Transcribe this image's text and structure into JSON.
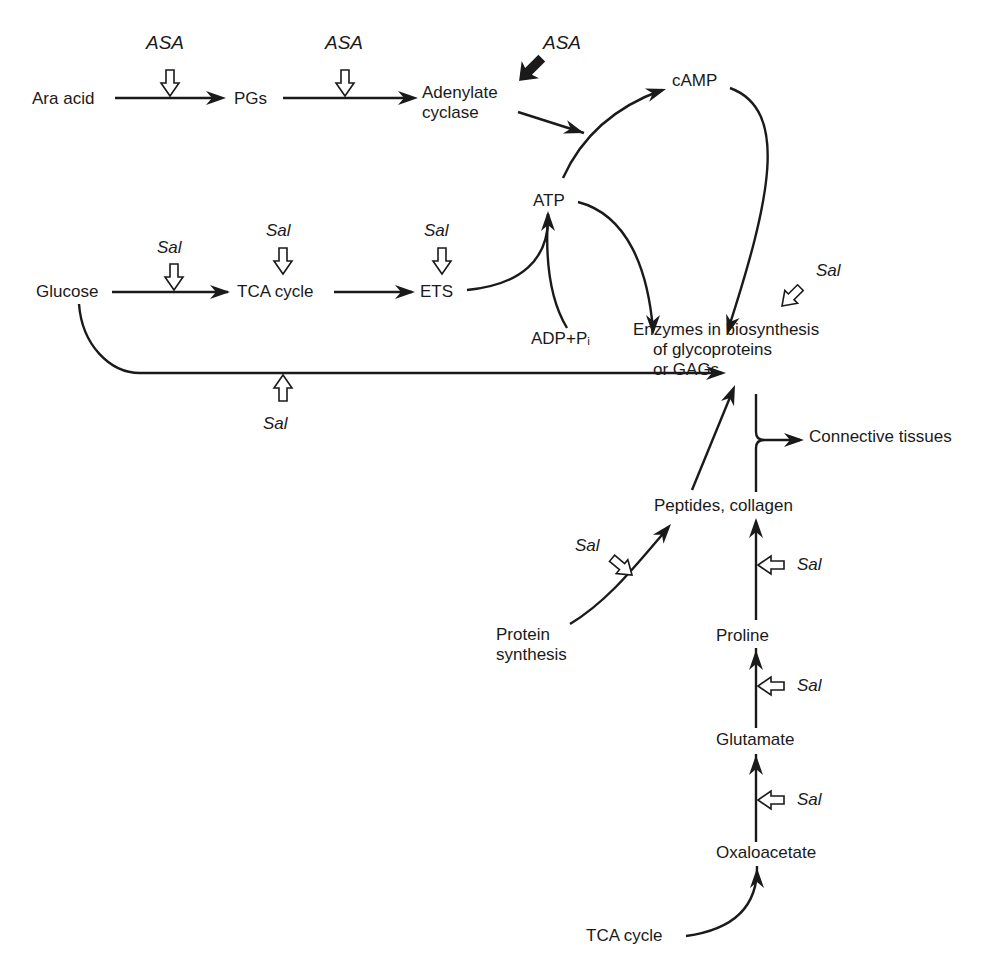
{
  "diagram": {
    "title": "",
    "nodes": [
      {
        "id": "ara_acid",
        "lines": [
          "Ara acid"
        ],
        "x": 32,
        "y": 104
      },
      {
        "id": "pgs",
        "lines": [
          "PGs"
        ],
        "x": 234,
        "y": 104
      },
      {
        "id": "adenylate_cyclase",
        "lines": [
          "Adenylate",
          "cyclase"
        ],
        "x": 422,
        "y": 98
      },
      {
        "id": "camp",
        "lines": [
          "cAMP"
        ],
        "x": 672,
        "y": 86
      },
      {
        "id": "atp",
        "lines": [
          "ATP"
        ],
        "x": 533,
        "y": 206
      },
      {
        "id": "glucose",
        "lines": [
          "Glucose"
        ],
        "x": 36,
        "y": 297
      },
      {
        "id": "tca_cycle_1",
        "lines": [
          "TCA cycle"
        ],
        "x": 237,
        "y": 297
      },
      {
        "id": "ets",
        "lines": [
          "ETS"
        ],
        "x": 420,
        "y": 297
      },
      {
        "id": "adp_pi",
        "lines": [
          "ADP+Pᵢ"
        ],
        "x": 531,
        "y": 344
      },
      {
        "id": "enzymes",
        "lines": [
          "Enzymes in biosynthesis",
          "of glycoproteins",
          "or GAGs"
        ],
        "x": 633,
        "y": 335
      },
      {
        "id": "connective_tissues",
        "lines": [
          "Connective tissues"
        ],
        "x": 809,
        "y": 442
      },
      {
        "id": "peptides_collagen",
        "lines": [
          "Peptides, collagen"
        ],
        "x": 654,
        "y": 511
      },
      {
        "id": "protein_synthesis",
        "lines": [
          "Protein",
          "synthesis"
        ],
        "x": 496,
        "y": 640
      },
      {
        "id": "proline",
        "lines": [
          "Proline"
        ],
        "x": 716,
        "y": 641
      },
      {
        "id": "glutamate",
        "lines": [
          "Glutamate"
        ],
        "x": 716,
        "y": 745
      },
      {
        "id": "oxaloacetate",
        "lines": [
          "Oxaloacetate"
        ],
        "x": 716,
        "y": 858
      },
      {
        "id": "tca_cycle_2",
        "lines": [
          "TCA cycle"
        ],
        "x": 586,
        "y": 941
      }
    ],
    "drug_labels": [
      {
        "id": "asa_1",
        "text": "ASA",
        "x": 146,
        "y": 49,
        "size": "asa"
      },
      {
        "id": "asa_2",
        "text": "ASA",
        "x": 325,
        "y": 49,
        "size": "asa"
      },
      {
        "id": "asa_3",
        "text": "ASA",
        "x": 543,
        "y": 49,
        "size": "asa"
      },
      {
        "id": "sal_1",
        "text": "Sal",
        "x": 157,
        "y": 253,
        "size": "sal"
      },
      {
        "id": "sal_2",
        "text": "Sal",
        "x": 266,
        "y": 236,
        "size": "sal"
      },
      {
        "id": "sal_3",
        "text": "Sal",
        "x": 424,
        "y": 236,
        "size": "sal"
      },
      {
        "id": "sal_4",
        "text": "Sal",
        "x": 263,
        "y": 429,
        "size": "sal"
      },
      {
        "id": "sal_5",
        "text": "Sal",
        "x": 816,
        "y": 276,
        "size": "sal"
      },
      {
        "id": "sal_6",
        "text": "Sal",
        "x": 575,
        "y": 551,
        "size": "sal"
      },
      {
        "id": "sal_7",
        "text": "Sal",
        "x": 797,
        "y": 570,
        "size": "sal"
      },
      {
        "id": "sal_8",
        "text": "Sal",
        "x": 797,
        "y": 691,
        "size": "sal"
      },
      {
        "id": "sal_9",
        "text": "Sal",
        "x": 797,
        "y": 805,
        "size": "sal"
      }
    ],
    "edges": [
      {
        "id": "ara_to_pgs",
        "d": "M 115 98 L 218 98"
      },
      {
        "id": "pgs_to_adenylate",
        "d": "M 283 98 L 412 98"
      },
      {
        "id": "adenylate_to_junction",
        "d": "M 518 112 L 584 133"
      },
      {
        "id": "atp_to_camp",
        "d": "M 563 178 C 580 140, 612 108, 662 90"
      },
      {
        "id": "camp_to_enzymes",
        "d": "M 730 88 C 790 110, 770 200, 728 330"
      },
      {
        "id": "atp_to_enzymes",
        "d": "M 578 202 C 628 215, 648 270, 653 330"
      },
      {
        "id": "glucose_to_tca",
        "d": "M 112 292 L 228 292"
      },
      {
        "id": "tca_to_ets",
        "d": "M 334 292 L 412 292"
      },
      {
        "id": "ets_to_atp",
        "d": "M 467 290 C 520 285, 550 260, 548 214"
      },
      {
        "id": "adp_to_atp",
        "d": "M 567 328 C 550 300, 545 260, 548 214"
      },
      {
        "id": "glucose_to_enzymes",
        "d": "M 79 304 C 82 345, 110 373, 140 373 L 722 373"
      },
      {
        "id": "peptides_to_enzymes",
        "d": "M 692 490 L 733 390"
      },
      {
        "id": "bracket_upper",
        "d": "M 756 394 L 756 432 Q 756 440 764 440"
      },
      {
        "id": "bracket_lower",
        "d": "M 756 492 L 756 448 Q 756 440 764 440"
      },
      {
        "id": "bracket_to_connective",
        "d": "M 764 440 L 800 440"
      },
      {
        "id": "protein_to_peptides",
        "d": "M 570 624 C 610 600, 640 560, 668 528"
      },
      {
        "id": "proline_to_peptides",
        "d": "M 756 620 L 756 522"
      },
      {
        "id": "glutamate_to_proline",
        "d": "M 756 728 L 756 648"
      },
      {
        "id": "oxaloacetate_to_glutamate",
        "d": "M 756 842 L 756 754"
      },
      {
        "id": "tca_to_oxaloacetate",
        "d": "M 686 936 C 730 930, 758 910, 757 866"
      }
    ],
    "arrowheads": [
      {
        "id": "ah_pgs",
        "x": 226,
        "y": 98,
        "angle": 0
      },
      {
        "id": "ah_adenylate",
        "x": 418,
        "y": 98,
        "angle": 0
      },
      {
        "id": "ah_junction",
        "x": 584,
        "y": 133,
        "angle": 18
      },
      {
        "id": "ah_camp",
        "x": 666,
        "y": 89,
        "angle": -18
      },
      {
        "id": "ah_enzymes_camp",
        "x": 727,
        "y": 335,
        "angle": 107
      },
      {
        "id": "ah_enzymes_atp",
        "x": 653,
        "y": 335,
        "angle": 90
      },
      {
        "id": "ah_tca",
        "x": 230,
        "y": 292,
        "angle": 0
      },
      {
        "id": "ah_ets",
        "x": 415,
        "y": 292,
        "angle": 0
      },
      {
        "id": "ah_atp",
        "x": 548,
        "y": 211,
        "angle": -90
      },
      {
        "id": "ah_enzymes_glucose",
        "x": 726,
        "y": 373,
        "angle": 0
      },
      {
        "id": "ah_enzymes_peptides",
        "x": 735,
        "y": 385,
        "angle": -68
      },
      {
        "id": "ah_connective",
        "x": 804,
        "y": 440,
        "angle": 0
      },
      {
        "id": "ah_peptides_protein",
        "x": 671,
        "y": 524,
        "angle": -50
      },
      {
        "id": "ah_peptides_proline",
        "x": 756,
        "y": 518,
        "angle": -90
      },
      {
        "id": "ah_proline",
        "x": 756,
        "y": 650,
        "angle": -90
      },
      {
        "id": "ah_glutamate",
        "x": 756,
        "y": 755,
        "angle": -90
      },
      {
        "id": "ah_oxaloacetate",
        "x": 757,
        "y": 868,
        "angle": -90
      }
    ],
    "inhibition_arrows": [
      {
        "id": "inh_asa_1",
        "x": 170,
        "y": 96,
        "angle": 90,
        "style": "open"
      },
      {
        "id": "inh_asa_2",
        "x": 345,
        "y": 96,
        "angle": 90,
        "style": "open"
      },
      {
        "id": "inh_asa_3",
        "x": 520,
        "y": 80,
        "angle": 135,
        "style": "solid"
      },
      {
        "id": "inh_sal_1",
        "x": 174,
        "y": 290,
        "angle": 90,
        "style": "open"
      },
      {
        "id": "inh_sal_2",
        "x": 283,
        "y": 274,
        "angle": 90,
        "style": "open"
      },
      {
        "id": "inh_sal_3",
        "x": 442,
        "y": 274,
        "angle": 90,
        "style": "open"
      },
      {
        "id": "inh_sal_4",
        "x": 283,
        "y": 375,
        "angle": -90,
        "style": "open"
      },
      {
        "id": "inh_sal_5",
        "x": 782,
        "y": 306,
        "angle": 135,
        "style": "open"
      },
      {
        "id": "inh_sal_6",
        "x": 632,
        "y": 575,
        "angle": 40,
        "style": "open"
      },
      {
        "id": "inh_sal_7",
        "x": 758,
        "y": 565,
        "angle": 180,
        "style": "open"
      },
      {
        "id": "inh_sal_8",
        "x": 758,
        "y": 686,
        "angle": 180,
        "style": "open"
      },
      {
        "id": "inh_sal_9",
        "x": 758,
        "y": 800,
        "angle": 180,
        "style": "open"
      }
    ]
  }
}
